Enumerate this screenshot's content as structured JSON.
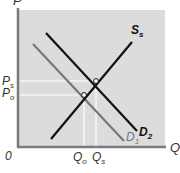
{
  "diagram": {
    "type": "supply-demand",
    "axes": {
      "y_label": "P",
      "x_label": "Q",
      "origin_label": "0"
    },
    "curves": [
      {
        "id": "S",
        "label_main": "S",
        "label_sub": "s",
        "color": "#111111"
      },
      {
        "id": "D2",
        "label_main": "D",
        "label_sub": "2",
        "color": "#111111"
      },
      {
        "id": "D1",
        "label_main": "D",
        "label_sub": "1",
        "color": "#777777"
      }
    ],
    "price_levels": [
      {
        "label_main": "P",
        "label_sub": "s"
      },
      {
        "label_main": "P",
        "label_sub": "o"
      }
    ],
    "quantity_levels": [
      {
        "label_main": "Q",
        "label_sub": "o"
      },
      {
        "label_main": "Q",
        "label_sub": "s"
      }
    ],
    "colors": {
      "plot_background": "#dcdcdc",
      "axis": "#7a7a7a",
      "guide_lines": "#ffffff"
    }
  }
}
